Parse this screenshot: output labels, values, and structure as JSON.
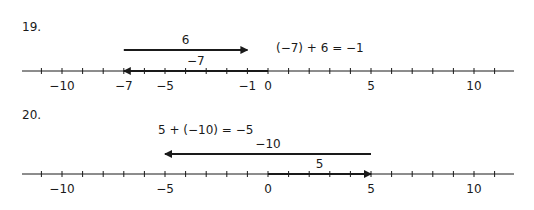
{
  "axis": {
    "min": -11,
    "max": 11,
    "origin_x": 268,
    "unit_px": 20.6,
    "start_x": 22,
    "end_x": 514,
    "labeled_ticks_default": [
      -10,
      -5,
      0,
      5,
      10
    ],
    "line_color": "#1a1a1a"
  },
  "problems": [
    {
      "number": "19.",
      "equation": "(−7) + 6 = −1",
      "axis_y": 71,
      "labeled_ticks": [
        {
          "value": -10,
          "label": "−10"
        },
        {
          "value": -7,
          "label": "−7"
        },
        {
          "value": -5,
          "label": "−5"
        },
        {
          "value": -1,
          "label": "−1"
        },
        {
          "value": 0,
          "label": "0"
        },
        {
          "value": 5,
          "label": "5"
        },
        {
          "value": 10,
          "label": "10"
        }
      ],
      "arrows": [
        {
          "from": 0,
          "to": -7,
          "label": "−7",
          "on_axis": true
        },
        {
          "from": -7,
          "to": -1,
          "label": "6",
          "on_axis": false,
          "y": 50
        }
      ]
    },
    {
      "number": "20.",
      "equation": "5 + (−10) = −5",
      "axis_y": 174,
      "labeled_ticks": [
        {
          "value": -10,
          "label": "−10"
        },
        {
          "value": -5,
          "label": "−5"
        },
        {
          "value": 0,
          "label": "0"
        },
        {
          "value": 5,
          "label": "5"
        },
        {
          "value": 10,
          "label": "10"
        }
      ],
      "arrows": [
        {
          "from": 0,
          "to": 5,
          "label": "5",
          "on_axis": true
        },
        {
          "from": 5,
          "to": -5,
          "label": "−10",
          "on_axis": false,
          "y": 154
        }
      ]
    }
  ]
}
